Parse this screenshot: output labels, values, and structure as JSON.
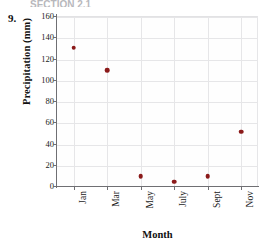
{
  "header": {
    "section_text": "SECTION 2.1"
  },
  "problem": {
    "number": "9."
  },
  "chart_data": {
    "type": "scatter",
    "title": "",
    "xlabel": "Month",
    "ylabel": "Precipitation (mm)",
    "categories": [
      "Jan",
      "Mar",
      "May",
      "July",
      "Sept",
      "Nov"
    ],
    "values": [
      131,
      110,
      10,
      5,
      10,
      52
    ],
    "ylim": [
      0,
      160
    ],
    "ytick_labels": [
      "0",
      "20",
      "40",
      "60",
      "80",
      "100",
      "120",
      "140",
      "160"
    ],
    "ytick_values": [
      0,
      20,
      40,
      60,
      80,
      100,
      120,
      140,
      160
    ],
    "grid": "both",
    "legend": "none",
    "marker_color": "#8b1a1a",
    "grid_color": "#e6e6e8",
    "axis_color": "#6f6f73",
    "background_color": "#fefefe"
  }
}
